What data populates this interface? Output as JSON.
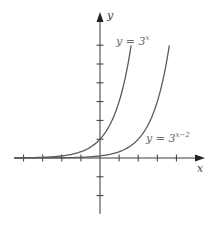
{
  "chart_data": {
    "type": "line",
    "title": "",
    "xlabel": "x",
    "ylabel": "y",
    "xlim": [
      -4.5,
      5.5
    ],
    "ylim": [
      -3,
      7.5
    ],
    "grid": false,
    "x_ticks": [
      -4,
      -3,
      -2,
      -1,
      1,
      2,
      3,
      4
    ],
    "y_ticks": [
      -2,
      -1,
      1,
      2,
      3,
      4,
      5,
      6
    ],
    "series": [
      {
        "name": "y = 3^x",
        "label_base": "y = 3",
        "label_exp": "x",
        "function": "3^x",
        "x_range": [
          -4.5,
          1.63
        ],
        "points": [
          [
            -4,
            0.012
          ],
          [
            -3,
            0.037
          ],
          [
            -2,
            0.111
          ],
          [
            -1,
            0.333
          ],
          [
            0,
            1
          ],
          [
            1,
            3
          ],
          [
            1.63,
            6
          ]
        ]
      },
      {
        "name": "y = 3^(x-2)",
        "label_base": "y = 3",
        "label_exp": "x−2",
        "function": "3^(x-2)",
        "x_range": [
          -4.5,
          3.63
        ],
        "points": [
          [
            -2,
            0.012
          ],
          [
            -1,
            0.037
          ],
          [
            0,
            0.111
          ],
          [
            1,
            0.333
          ],
          [
            2,
            1
          ],
          [
            3,
            3
          ],
          [
            3.63,
            6
          ]
        ]
      }
    ]
  },
  "axes": {
    "x_label": "x",
    "y_label": "y"
  },
  "colors": {
    "axis": "#3a3a3a",
    "curve": "#5a5a5a",
    "label": "#6a6a6a"
  }
}
